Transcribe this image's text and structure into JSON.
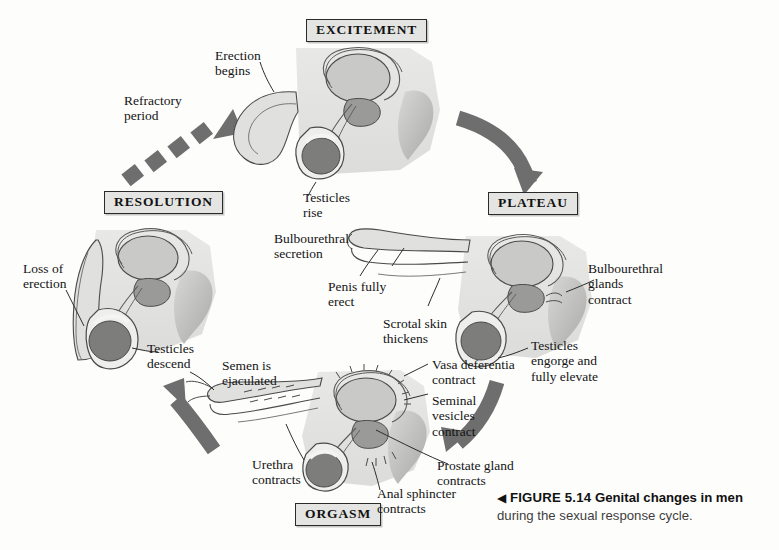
{
  "figure": {
    "marker": "◀",
    "number": "FIGURE 5.14",
    "lead": "Genital changes in men",
    "rest": "during the sexual response cycle."
  },
  "stages": [
    {
      "id": "excitement",
      "label": "EXCITEMENT"
    },
    {
      "id": "plateau",
      "label": "PLATEAU"
    },
    {
      "id": "orgasm",
      "label": "ORGASM"
    },
    {
      "id": "resolution",
      "label": "RESOLUTION"
    }
  ],
  "annotations": {
    "erection_begins": "Erection\nbegins",
    "refractory_period": "Refractory\nperiod",
    "testicles_rise": "Testicles\nrise",
    "bulbourethral_secretion": "Bulbourethral\nsecretion",
    "penis_fully_erect": "Penis fully\nerect",
    "scrotal_skin_thickens": "Scrotal skin\nthickens",
    "bulbourethral_glands_contract": "Bulbourethral\nglands\ncontract",
    "testicles_engorge": "Testicles\nengorge and\nfully elevate",
    "vasa_deferentia_contract": "Vasa deferentia\ncontract",
    "seminal_vesicles_contract": "Seminal\nvesicles\ncontract",
    "prostate_gland_contracts": "Prostate gland\ncontracts",
    "anal_sphincter_contracts": "Anal sphincter\ncontracts",
    "urethra_contracts": "Urethra\ncontracts",
    "semen_is_ejaculated": "Semen is\nejaculated",
    "loss_of_erection": "Loss of\nerection",
    "testicles_descend": "Testicles\ndescend"
  },
  "colors": {
    "arrow_gray": "#6e6e6e",
    "body_fill": "#e3e3e1",
    "bladder_fill": "#c9c9c7",
    "prostate_fill": "#9a9a98",
    "testicle_fill": "#7d7d7b",
    "outline": "#4a4a4a",
    "label_box_fill": "#e4e4e2",
    "page_background": "#fdfdfc"
  }
}
